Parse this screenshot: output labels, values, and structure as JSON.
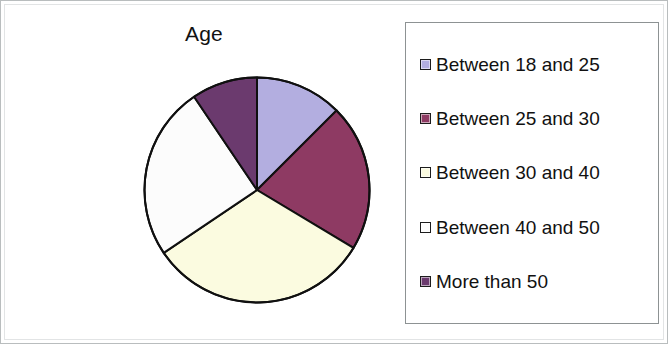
{
  "chart_data": {
    "type": "pie",
    "title": "Age",
    "xlabel": "",
    "ylabel": "",
    "legend_position": "right",
    "grid": false,
    "categories": [
      "Between 18 and 25",
      "Between 25 and 30",
      "Between 30 and 40",
      "Between 40 and 50",
      "More than 50"
    ],
    "values": [
      12.5,
      21.1,
      31.9,
      25.0,
      9.5
    ],
    "angles_deg": [
      45,
      76,
      115,
      90,
      34
    ],
    "start_angle_deg": 0,
    "direction": "clockwise",
    "colors": [
      "#b3aee0",
      "#8e3a63",
      "#fbfbe0",
      "#fcfcfc",
      "#6b3a6e"
    ],
    "slice_border_color": "#101010",
    "series": [
      {
        "name": "Age",
        "values": [
          12.5,
          21.1,
          31.9,
          25.0,
          9.5
        ]
      }
    ]
  },
  "chart": {
    "title": "Age"
  },
  "legend": {
    "items": [
      {
        "label": "Between 18 and 25",
        "color": "#b3aee0"
      },
      {
        "label": "Between 25 and 30",
        "color": "#8e3a63"
      },
      {
        "label": "Between 30 and 40",
        "color": "#fbfbe0"
      },
      {
        "label": "Between 40 and 50",
        "color": "#fcfcfc"
      },
      {
        "label": "More than 50",
        "color": "#6b3a6e"
      }
    ]
  }
}
